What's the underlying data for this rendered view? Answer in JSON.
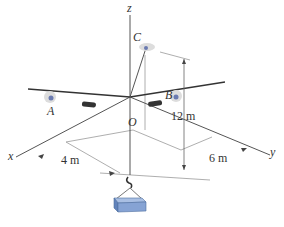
{
  "diagram": {
    "axes": {
      "x": "x",
      "y": "y",
      "z": "z"
    },
    "points": {
      "A": "A",
      "B": "B",
      "C": "C",
      "O": "O"
    },
    "dimensions": {
      "height": "12 m",
      "x_offset": "4 m",
      "y_offset": "6 m"
    },
    "colors": {
      "line": "#4a4a4a",
      "thin": "#888888",
      "box": "#7a9ccc",
      "box_dark": "#4f6fa0",
      "glow": "#d8d8e0"
    }
  }
}
